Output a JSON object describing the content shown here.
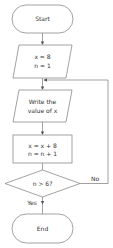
{
  "flowchart": {
    "start": {
      "label": "Start"
    },
    "init": {
      "line1": "x = 8",
      "line2": "n = 1"
    },
    "output": {
      "line1": "Write the",
      "line2": "value of x"
    },
    "process": {
      "line1": "x = x + 8",
      "line2": "n = n + 1"
    },
    "decision": {
      "label": "n > 6?"
    },
    "branches": {
      "no": "No",
      "yes": "Yes"
    },
    "end": {
      "label": "End"
    }
  },
  "colors": {
    "stroke": "#8a8a8a",
    "text": "#333333",
    "background": "#ffffff"
  }
}
